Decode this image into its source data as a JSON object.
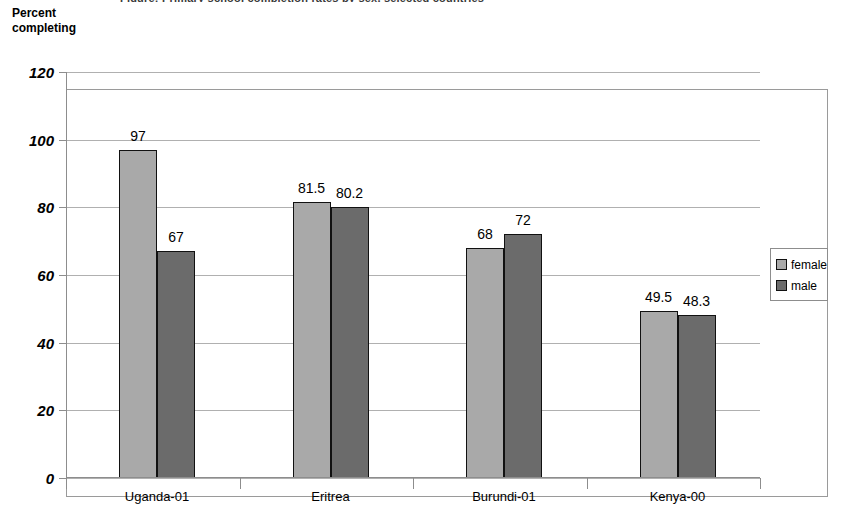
{
  "axis_title": "Percent\ncompleting",
  "title_remnant": "Figure: Primary school completion rates by sex, selected countries",
  "legend": {
    "items": [
      {
        "label": "female",
        "color": "#a9a9a9"
      },
      {
        "label": "male",
        "color": "#6b6b6b"
      }
    ]
  },
  "chart_data": {
    "type": "bar",
    "title": "",
    "subtitle": "",
    "xlabel": "",
    "ylabel": "Percent completing",
    "categories": [
      "Uganda-01",
      "Eritrea",
      "Burundi-01",
      "Kenya-00"
    ],
    "series": [
      {
        "name": "female",
        "color": "#a9a9a9",
        "values": [
          97,
          81.5,
          68,
          49.5
        ],
        "labels": [
          "97",
          "81.5",
          "68",
          "49.5"
        ]
      },
      {
        "name": "male",
        "color": "#6b6b6b",
        "values": [
          67,
          80.2,
          72,
          48.3
        ],
        "labels": [
          "67",
          "80.2",
          "72",
          "48.3"
        ]
      }
    ],
    "ylim": [
      0,
      120
    ],
    "yticks": [
      0,
      20,
      40,
      60,
      80,
      100,
      120
    ],
    "ytick_labels": [
      "0",
      "20",
      "40",
      "60",
      "80",
      "100",
      "120"
    ],
    "grid": true,
    "grid_axis": "y",
    "legend_position": "right"
  }
}
